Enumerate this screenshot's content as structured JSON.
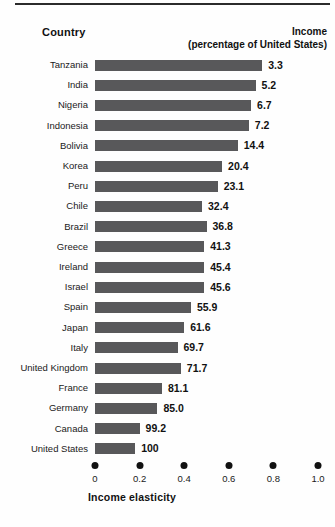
{
  "header": {
    "country_label": "Country",
    "income_label": "Income",
    "income_sublabel": "(percentage of United States)"
  },
  "axis": {
    "title": "Income elasticity",
    "tick_labels": [
      "0",
      "0.2",
      "0.4",
      "0.6",
      "0.8",
      "1.0"
    ]
  },
  "colors": {
    "bar": "#58585a",
    "text": "#1a1a1a",
    "rule": "#2b2b2b"
  },
  "chart_data": {
    "type": "bar",
    "orientation": "horizontal",
    "title": "",
    "xlabel": "Income elasticity",
    "ylabel": "Country",
    "xlim": [
      0,
      1.0
    ],
    "xticks": [
      0,
      0.2,
      0.4,
      0.6,
      0.8,
      1.0
    ],
    "grid": false,
    "legend": "none",
    "value_label_header": "Income (percentage of United States)",
    "categories": [
      "Tanzania",
      "India",
      "Nigeria",
      "Indonesia",
      "Bolivia",
      "Korea",
      "Peru",
      "Chile",
      "Brazil",
      "Greece",
      "Ireland",
      "Israel",
      "Spain",
      "Japan",
      "Italy",
      "United Kingdom",
      "France",
      "Germany",
      "Canada",
      "United States"
    ],
    "values": [
      0.75,
      0.72,
      0.7,
      0.69,
      0.64,
      0.57,
      0.55,
      0.48,
      0.5,
      0.49,
      0.49,
      0.49,
      0.43,
      0.4,
      0.37,
      0.385,
      0.3,
      0.28,
      0.2,
      0.18
    ],
    "annotations": [
      "3.3",
      "5.2",
      "6.7",
      "7.2",
      "14.4",
      "20.4",
      "23.1",
      "32.4",
      "36.8",
      "41.3",
      "45.4",
      "45.6",
      "55.9",
      "61.6",
      "69.7",
      "71.7",
      "81.1",
      "85.0",
      "99.2",
      "100"
    ],
    "rows": [
      {
        "country": "Tanzania",
        "income": "3.3",
        "elasticity": 0.75
      },
      {
        "country": "India",
        "income": "5.2",
        "elasticity": 0.72
      },
      {
        "country": "Nigeria",
        "income": "6.7",
        "elasticity": 0.7
      },
      {
        "country": "Indonesia",
        "income": "7.2",
        "elasticity": 0.69
      },
      {
        "country": "Bolivia",
        "income": "14.4",
        "elasticity": 0.64
      },
      {
        "country": "Korea",
        "income": "20.4",
        "elasticity": 0.57
      },
      {
        "country": "Peru",
        "income": "23.1",
        "elasticity": 0.55
      },
      {
        "country": "Chile",
        "income": "32.4",
        "elasticity": 0.48
      },
      {
        "country": "Brazil",
        "income": "36.8",
        "elasticity": 0.5
      },
      {
        "country": "Greece",
        "income": "41.3",
        "elasticity": 0.49
      },
      {
        "country": "Ireland",
        "income": "45.4",
        "elasticity": 0.49
      },
      {
        "country": "Israel",
        "income": "45.6",
        "elasticity": 0.49
      },
      {
        "country": "Spain",
        "income": "55.9",
        "elasticity": 0.43
      },
      {
        "country": "Japan",
        "income": "61.6",
        "elasticity": 0.4
      },
      {
        "country": "Italy",
        "income": "69.7",
        "elasticity": 0.37
      },
      {
        "country": "United Kingdom",
        "income": "71.7",
        "elasticity": 0.385
      },
      {
        "country": "France",
        "income": "81.1",
        "elasticity": 0.3
      },
      {
        "country": "Germany",
        "income": "85.0",
        "elasticity": 0.28
      },
      {
        "country": "Canada",
        "income": "99.2",
        "elasticity": 0.2
      },
      {
        "country": "United States",
        "income": "100",
        "elasticity": 0.18
      }
    ]
  }
}
